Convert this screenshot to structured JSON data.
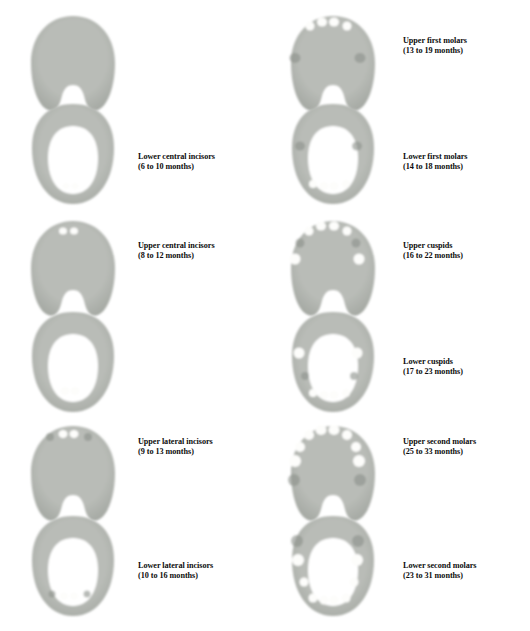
{
  "figure": {
    "kind": "primary-tooth-eruption-chart",
    "background_color": "#ffffff",
    "text_color": "#0d0d0d",
    "gum_color": "#b9bcb7",
    "gum_shadow_color": "#a2a6a0",
    "tooth_color": "#fdfdfb",
    "socket_color": "#8d918b"
  },
  "columns": [
    {
      "name": "left-column",
      "stages": [
        {
          "id": "lower-central-incisors",
          "arch_upper": {
            "name": "upper-arch-no-teeth",
            "type": "upper",
            "teeth": [],
            "sockets": []
          },
          "arch_lower": {
            "name": "lower-arch-lower-central-incisors",
            "type": "lower",
            "teeth": [
              {
                "pos": "lower-central-incisor-left",
                "x": 48,
                "y": 86,
                "w": 7,
                "h": 6
              },
              {
                "pos": "lower-central-incisor-right",
                "x": 57,
                "y": 86,
                "w": 7,
                "h": 6
              }
            ],
            "sockets": []
          },
          "label": {
            "title": "Lower central incisors",
            "months": "(6 to 10 months)"
          }
        },
        {
          "id": "upper-central-incisors",
          "arch_upper": {
            "name": "upper-arch-upper-central-incisors",
            "type": "upper",
            "teeth": [
              {
                "pos": "upper-central-incisor-left",
                "x": 45,
                "y": 16,
                "w": 8,
                "h": 7
              },
              {
                "pos": "upper-central-incisor-right",
                "x": 56,
                "y": 16,
                "w": 8,
                "h": 7
              }
            ],
            "sockets": []
          },
          "arch_lower": {
            "name": "lower-arch-lower-central-incisors-erupted",
            "type": "lower",
            "teeth": [
              {
                "pos": "lower-central-incisor-left",
                "x": 47,
                "y": 83,
                "w": 9,
                "h": 8
              },
              {
                "pos": "lower-central-incisor-right",
                "x": 57,
                "y": 83,
                "w": 9,
                "h": 8
              }
            ],
            "sockets": []
          },
          "label": {
            "title": "Upper central incisors",
            "months": "(8 to 12 months)"
          }
        },
        {
          "id": "upper-lower-lateral-incisors",
          "arch_upper": {
            "name": "upper-arch-upper-lateral-incisors",
            "type": "upper",
            "teeth": [
              {
                "pos": "upper-central-incisor-left",
                "x": 45,
                "y": 14,
                "w": 9,
                "h": 8
              },
              {
                "pos": "upper-central-incisor-right",
                "x": 56,
                "y": 14,
                "w": 9,
                "h": 8
              }
            ],
            "sockets": [
              {
                "pos": "upper-lateral-incisor-left",
                "x": 32,
                "y": 17,
                "w": 8,
                "h": 8
              },
              {
                "pos": "upper-lateral-incisor-right",
                "x": 70,
                "y": 17,
                "w": 8,
                "h": 8
              }
            ]
          },
          "arch_lower": {
            "name": "lower-arch-lower-lateral-incisors",
            "type": "lower",
            "teeth": [
              {
                "pos": "lower-central-incisor-left",
                "x": 46,
                "y": 84,
                "w": 8,
                "h": 7
              },
              {
                "pos": "lower-central-incisor-right",
                "x": 56,
                "y": 84,
                "w": 8,
                "h": 7
              }
            ],
            "sockets": [
              {
                "pos": "lower-lateral-incisor-left",
                "x": 34,
                "y": 82,
                "w": 7,
                "h": 7
              },
              {
                "pos": "lower-lateral-incisor-right",
                "x": 69,
                "y": 82,
                "w": 7,
                "h": 7
              }
            ]
          },
          "label_upper": {
            "title": "Upper lateral incisors",
            "months": "(9 to 13 months)"
          },
          "label_lower": {
            "title": "Lower lateral incisors",
            "months": "(10 to 16 months)"
          }
        }
      ]
    },
    {
      "name": "right-column",
      "stages": [
        {
          "id": "upper-lower-first-molars",
          "arch_upper": {
            "name": "upper-arch-upper-first-molars",
            "type": "upper",
            "teeth": [
              {
                "pos": "upper-lateral-incisor-left",
                "x": 32,
                "y": 16,
                "w": 9,
                "h": 9
              },
              {
                "pos": "upper-central-incisor-left",
                "x": 44,
                "y": 12,
                "w": 10,
                "h": 9
              },
              {
                "pos": "upper-central-incisor-right",
                "x": 56,
                "y": 12,
                "w": 10,
                "h": 9
              },
              {
                "pos": "upper-lateral-incisor-right",
                "x": 69,
                "y": 16,
                "w": 9,
                "h": 9
              }
            ],
            "sockets": [
              {
                "pos": "upper-first-molar-left",
                "x": 17,
                "y": 48,
                "w": 11,
                "h": 10
              },
              {
                "pos": "upper-first-molar-right",
                "x": 82,
                "y": 48,
                "w": 11,
                "h": 10
              }
            ]
          },
          "arch_lower": {
            "name": "lower-arch-lower-first-molars",
            "type": "lower",
            "teeth": [
              {
                "pos": "lower-lateral-incisor-left",
                "x": 35,
                "y": 84,
                "w": 8,
                "h": 8
              },
              {
                "pos": "lower-central-incisor-left",
                "x": 46,
                "y": 86,
                "w": 9,
                "h": 8
              },
              {
                "pos": "lower-central-incisor-right",
                "x": 56,
                "y": 86,
                "w": 9,
                "h": 8
              },
              {
                "pos": "lower-lateral-incisor-right",
                "x": 68,
                "y": 84,
                "w": 8,
                "h": 8
              }
            ],
            "sockets": [
              {
                "pos": "lower-first-molar-left",
                "x": 22,
                "y": 46,
                "w": 10,
                "h": 9
              },
              {
                "pos": "lower-first-molar-right",
                "x": 79,
                "y": 46,
                "w": 10,
                "h": 9
              }
            ]
          },
          "label_upper": {
            "title": "Upper first molars",
            "months": "(13 to 19 months)"
          },
          "label_lower": {
            "title": "Lower first molars",
            "months": "(14 to 18 months)"
          }
        },
        {
          "id": "upper-lower-cuspids",
          "arch_upper": {
            "name": "upper-arch-upper-cuspids",
            "type": "upper",
            "teeth": [
              {
                "pos": "upper-lateral-incisor-left",
                "x": 31,
                "y": 16,
                "w": 9,
                "h": 9
              },
              {
                "pos": "upper-central-incisor-left",
                "x": 43,
                "y": 11,
                "w": 10,
                "h": 9
              },
              {
                "pos": "upper-central-incisor-right",
                "x": 56,
                "y": 11,
                "w": 10,
                "h": 9
              },
              {
                "pos": "upper-lateral-incisor-right",
                "x": 69,
                "y": 16,
                "w": 9,
                "h": 9
              },
              {
                "pos": "upper-first-molar-left",
                "x": 17,
                "y": 44,
                "w": 11,
                "h": 11
              },
              {
                "pos": "upper-first-molar-right",
                "x": 81,
                "y": 44,
                "w": 11,
                "h": 11
              }
            ],
            "sockets": [
              {
                "pos": "upper-cuspid-left",
                "x": 22,
                "y": 28,
                "w": 9,
                "h": 9
              },
              {
                "pos": "upper-cuspid-right",
                "x": 78,
                "y": 28,
                "w": 9,
                "h": 9
              }
            ]
          },
          "arch_lower": {
            "name": "lower-arch-lower-cuspids",
            "type": "lower",
            "teeth": [
              {
                "pos": "lower-lateral-incisor-left",
                "x": 35,
                "y": 85,
                "w": 8,
                "h": 8
              },
              {
                "pos": "lower-central-incisor-left",
                "x": 46,
                "y": 87,
                "w": 9,
                "h": 8
              },
              {
                "pos": "lower-central-incisor-right",
                "x": 56,
                "y": 87,
                "w": 9,
                "h": 8
              },
              {
                "pos": "lower-lateral-incisor-right",
                "x": 68,
                "y": 85,
                "w": 8,
                "h": 8
              },
              {
                "pos": "lower-first-molar-left",
                "x": 21,
                "y": 45,
                "w": 11,
                "h": 11
              },
              {
                "pos": "lower-first-molar-right",
                "x": 79,
                "y": 45,
                "w": 11,
                "h": 11
              }
            ],
            "sockets": [
              {
                "pos": "lower-cuspid-left",
                "x": 27,
                "y": 68,
                "w": 8,
                "h": 8
              },
              {
                "pos": "lower-cuspid-right",
                "x": 76,
                "y": 68,
                "w": 8,
                "h": 8
              }
            ]
          },
          "label_upper": {
            "title": "Upper cuspids",
            "months": "(16 to 22 months)"
          },
          "label_lower": {
            "title": "Lower cuspids",
            "months": "(17 to 23 months)"
          }
        },
        {
          "id": "upper-lower-second-molars",
          "arch_upper": {
            "name": "upper-arch-upper-second-molars",
            "type": "upper",
            "teeth": [
              {
                "pos": "upper-lateral-incisor-left",
                "x": 31,
                "y": 15,
                "w": 10,
                "h": 10
              },
              {
                "pos": "upper-central-incisor-left",
                "x": 43,
                "y": 10,
                "w": 11,
                "h": 10
              },
              {
                "pos": "upper-central-incisor-right",
                "x": 56,
                "y": 10,
                "w": 11,
                "h": 10
              },
              {
                "pos": "upper-lateral-incisor-right",
                "x": 69,
                "y": 15,
                "w": 10,
                "h": 10
              },
              {
                "pos": "upper-cuspid-left",
                "x": 22,
                "y": 27,
                "w": 10,
                "h": 10
              },
              {
                "pos": "upper-cuspid-right",
                "x": 78,
                "y": 27,
                "w": 10,
                "h": 10
              },
              {
                "pos": "upper-first-molar-left",
                "x": 17,
                "y": 41,
                "w": 12,
                "h": 12
              },
              {
                "pos": "upper-first-molar-right",
                "x": 81,
                "y": 41,
                "w": 12,
                "h": 12
              }
            ],
            "sockets": [
              {
                "pos": "upper-second-molar-left",
                "x": 16,
                "y": 60,
                "w": 12,
                "h": 12
              },
              {
                "pos": "upper-second-molar-right",
                "x": 82,
                "y": 60,
                "w": 12,
                "h": 12
              }
            ]
          },
          "arch_lower": {
            "name": "lower-arch-lower-second-molars",
            "type": "lower",
            "teeth": [
              {
                "pos": "lower-lateral-incisor-left",
                "x": 35,
                "y": 86,
                "w": 9,
                "h": 9
              },
              {
                "pos": "lower-central-incisor-left",
                "x": 46,
                "y": 88,
                "w": 9,
                "h": 9
              },
              {
                "pos": "lower-central-incisor-right",
                "x": 56,
                "y": 88,
                "w": 9,
                "h": 9
              },
              {
                "pos": "lower-lateral-incisor-right",
                "x": 68,
                "y": 86,
                "w": 9,
                "h": 9
              },
              {
                "pos": "lower-cuspid-left",
                "x": 26,
                "y": 70,
                "w": 9,
                "h": 9
              },
              {
                "pos": "lower-cuspid-right",
                "x": 76,
                "y": 70,
                "w": 9,
                "h": 9
              },
              {
                "pos": "lower-first-molar-left",
                "x": 20,
                "y": 48,
                "w": 12,
                "h": 12
              },
              {
                "pos": "lower-first-molar-right",
                "x": 79,
                "y": 48,
                "w": 12,
                "h": 12
              }
            ],
            "sockets": [
              {
                "pos": "lower-second-molar-left",
                "x": 19,
                "y": 29,
                "w": 12,
                "h": 12
              },
              {
                "pos": "lower-second-molar-right",
                "x": 80,
                "y": 29,
                "w": 12,
                "h": 12
              }
            ]
          },
          "label_upper": {
            "title": "Upper second molars",
            "months": "(25 to 33 months)"
          },
          "label_lower": {
            "title": "Lower second molars",
            "months": "(23 to 31 months)"
          }
        }
      ]
    }
  ],
  "labels_flat": [
    {
      "id": "label-lower-central-incisors",
      "title": "Lower central incisors",
      "months": "(6 to 10 months)"
    },
    {
      "id": "label-upper-central-incisors",
      "title": "Upper central incisors",
      "months": "(8 to 12 months)"
    },
    {
      "id": "label-upper-lateral-incisors",
      "title": "Upper lateral incisors",
      "months": "(9 to 13 months)"
    },
    {
      "id": "label-lower-lateral-incisors",
      "title": "Lower lateral incisors",
      "months": "(10 to 16 months)"
    },
    {
      "id": "label-upper-first-molars",
      "title": "Upper first molars",
      "months": "(13 to 19 months)"
    },
    {
      "id": "label-lower-first-molars",
      "title": "Lower first molars",
      "months": "(14 to 18 months)"
    },
    {
      "id": "label-upper-cuspids",
      "title": "Upper cuspids",
      "months": "(16 to 22 months)"
    },
    {
      "id": "label-lower-cuspids",
      "title": "Lower cuspids",
      "months": "(17 to 23 months)"
    },
    {
      "id": "label-upper-second-molars",
      "title": "Upper second molars",
      "months": "(25 to 33 months)"
    },
    {
      "id": "label-lower-second-molars",
      "title": "Lower second molars",
      "months": "(23 to 31 months)"
    }
  ]
}
